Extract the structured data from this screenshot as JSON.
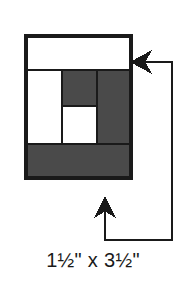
{
  "figure": {
    "name": "log-cabin-block-strip-diagram",
    "caption": "1½\" x 3½\"",
    "caption_parts": {
      "width_measure": "1½\"",
      "separator": "x",
      "length_measure": "3½\""
    }
  },
  "colors": {
    "fabric_dark": "#4a4a4a",
    "fabric_light": "#ffffff",
    "outline": "#1a1a1a",
    "arrow": "#1a1a1a",
    "background": "#ffffff",
    "caption_text": "#1a1a1a"
  },
  "block": {
    "label": "pieced-block",
    "outline_width": 3,
    "bounds": {
      "x": 26,
      "y": 36,
      "width": 105,
      "height": 142
    },
    "patches": [
      {
        "name": "top-light-strip",
        "fabric": "light",
        "x": 26,
        "y": 36,
        "width": 105,
        "height": 34
      },
      {
        "name": "left-light-strip",
        "fabric": "light",
        "x": 26,
        "y": 70,
        "width": 36,
        "height": 74
      },
      {
        "name": "top-center-dark-patch",
        "fabric": "dark",
        "x": 62,
        "y": 70,
        "width": 35,
        "height": 36
      },
      {
        "name": "right-dark-strip",
        "fabric": "dark",
        "x": 97,
        "y": 70,
        "width": 34,
        "height": 74
      },
      {
        "name": "center-light-square",
        "fabric": "light",
        "x": 62,
        "y": 106,
        "width": 35,
        "height": 38
      },
      {
        "name": "bottom-dark-strip",
        "fabric": "dark",
        "x": 26,
        "y": 144,
        "width": 105,
        "height": 34
      }
    ],
    "seam_lines": [
      {
        "name": "seam-top-horizontal",
        "x1": 26,
        "y1": 70,
        "x2": 131,
        "y2": 70
      },
      {
        "name": "seam-bottom-horizontal",
        "x1": 26,
        "y1": 144,
        "x2": 131,
        "y2": 144
      },
      {
        "name": "seam-left-vertical",
        "x1": 62,
        "y1": 70,
        "x2": 62,
        "y2": 144
      },
      {
        "name": "seam-right-vertical",
        "x1": 97,
        "y1": 70,
        "x2": 97,
        "y2": 144
      },
      {
        "name": "seam-center-horizontal",
        "x1": 62,
        "y1": 106,
        "x2": 97,
        "y2": 106
      }
    ]
  },
  "callouts": [
    {
      "name": "top-strip-callout",
      "direction": "left",
      "line_width": 2,
      "path": "M 172 58 L 172 62 L 142 62",
      "arrow_tip": {
        "x": 131,
        "y": 62
      },
      "points_to": "top-light-strip"
    },
    {
      "name": "bottom-strip-callout",
      "direction": "up",
      "line_width": 2,
      "path": "M 172 58 L 172 240 L 105 240 L 105 210",
      "arrow_tip": {
        "x": 105,
        "y": 197
      },
      "points_to": "bottom-dark-strip"
    }
  ]
}
